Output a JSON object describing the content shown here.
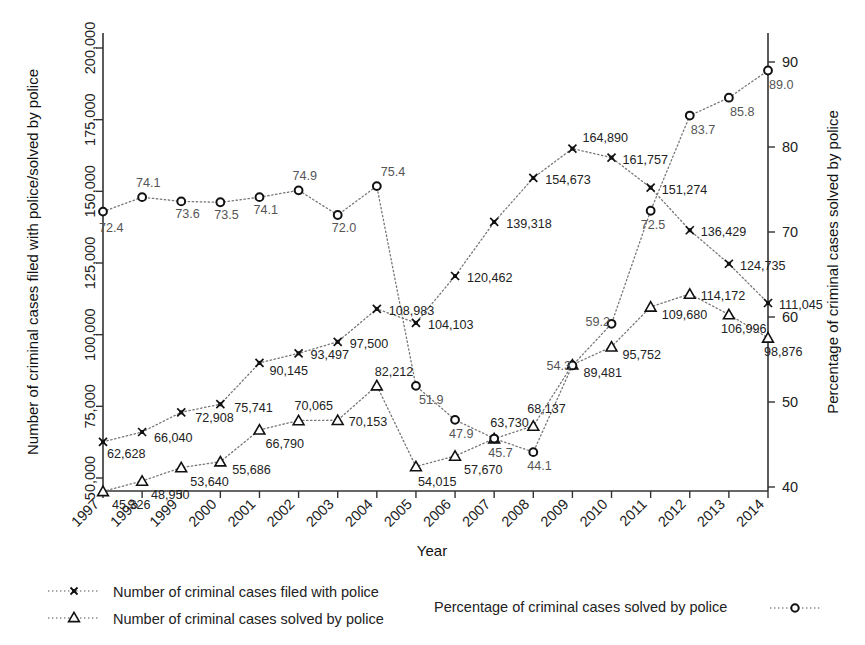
{
  "chart_data": {
    "type": "line",
    "title": "",
    "xlabel": "Year",
    "ylabel_left": "Number of criminal cases filed with police/solved by police",
    "ylabel_right": "Percentage of criminal cases solved by police",
    "categories": [
      "1997",
      "1998",
      "1999",
      "2000",
      "2001",
      "2002",
      "2003",
      "2004",
      "2005",
      "2006",
      "2007",
      "2008",
      "2009",
      "2010",
      "2011",
      "2012",
      "2013",
      "2014"
    ],
    "ylim_left": [
      50000,
      200000
    ],
    "yticks_left": [
      "50,000",
      "75,000",
      "100,000",
      "125,000",
      "150,000",
      "175,000",
      "200,000"
    ],
    "ylim_right": [
      40,
      90
    ],
    "yticks_right": [
      "40",
      "50",
      "60",
      "70",
      "80",
      "90"
    ],
    "grid": false,
    "legend_position": "bottom",
    "series": [
      {
        "name": "Number of criminal cases filed with police",
        "marker": "x",
        "axis": "left",
        "values": [
          62628,
          66040,
          72908,
          75741,
          90145,
          93497,
          97500,
          108983,
          104103,
          120462,
          139318,
          154673,
          164890,
          161757,
          151274,
          136429,
          124735,
          111045
        ],
        "labels": [
          "62,628",
          "66,040",
          "72,908",
          "75,741",
          "90,145",
          "93,497",
          "97,500",
          "108,983",
          "104,103",
          "120,462",
          "139,318",
          "154,673",
          "164,890",
          "161,757",
          "151,274",
          "136,429",
          "124,735",
          "111,045"
        ]
      },
      {
        "name": "Number of criminal cases solved by police",
        "marker": "triangle",
        "axis": "left",
        "values": [
          45326,
          48950,
          53640,
          55686,
          66790,
          70065,
          70153,
          82212,
          54015,
          57670,
          63730,
          68137,
          89481,
          95752,
          109680,
          114172,
          106996,
          98876
        ],
        "labels": [
          "45,326",
          "48,950",
          "53,640",
          "55,686",
          "66,790",
          "70,065",
          "70,153",
          "82,212",
          "54,015",
          "57,670",
          "63,730",
          "68,137",
          "89,481",
          "95,752",
          "109,680",
          "114,172",
          "106,996",
          "98,876"
        ]
      },
      {
        "name": "Percentage of criminal cases solved by police",
        "marker": "circle",
        "axis": "right",
        "values": [
          72.4,
          74.1,
          73.6,
          73.5,
          74.1,
          74.9,
          72.0,
          75.4,
          51.9,
          47.9,
          45.7,
          44.1,
          54.3,
          59.2,
          72.5,
          83.7,
          85.8,
          89.0
        ],
        "labels": [
          "72.4",
          "74.1",
          "73.6",
          "73.5",
          "74.1",
          "74.9",
          "72.0",
          "75.4",
          "51.9",
          "47.9",
          "45.7",
          "44.1",
          "54.3",
          "59.2",
          "72.5",
          "83.7",
          "85.8",
          "89.0"
        ]
      }
    ]
  },
  "axes": {
    "x_label": "Year",
    "y_left_label": "Number of criminal cases filed with police/solved by police",
    "y_right_label": "Percentage of criminal cases solved by police"
  },
  "legend": {
    "items": [
      {
        "label": "Number of criminal cases filed with police",
        "marker": "x-marker"
      },
      {
        "label": "Number of criminal cases solved by police",
        "marker": "triangle-marker"
      },
      {
        "label": "Percentage of criminal cases solved by police",
        "marker": "circle-marker"
      }
    ]
  },
  "colors": {
    "ink": "#111111",
    "axis": "#333333",
    "dotted": "#7a7a7a",
    "background": "#ffffff"
  }
}
